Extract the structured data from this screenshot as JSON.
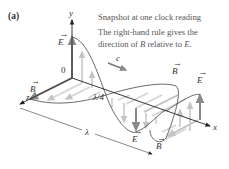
{
  "figure": {
    "panel_label": "(a)",
    "caption_lines": [
      "Snapshot at one clock reading",
      "The right-hand rule gives the",
      "direction of B relative to E."
    ],
    "caption_vectors": [
      "B",
      "E"
    ]
  },
  "axes": {
    "x_label": "x",
    "y_label": "y",
    "z_label": "z",
    "origin_label": "0"
  },
  "wave": {
    "speed_label": "c",
    "quarter_wavelength_label": "λ/4",
    "wavelength_label": "λ",
    "vectors": {
      "e_field_left": "E",
      "b_field_left": "B",
      "e_field_bottom": "E",
      "b_field_bottom": "B",
      "b_field_right": "B",
      "e_field_right": "E"
    }
  },
  "colors": {
    "axis": "#222222",
    "e_field_dark": "#8a8a8a",
    "e_field_light": "#c8c8c8",
    "b_field_dark": "#9a9a9a",
    "b_field_light": "#d4d4d4",
    "curve": "#444444",
    "text": "#555555"
  }
}
